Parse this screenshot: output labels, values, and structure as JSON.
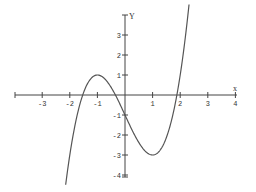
{
  "chart_data": {
    "type": "line",
    "title": "",
    "xlabel": "x",
    "ylabel": "Y",
    "xlim": [
      -4,
      4
    ],
    "ylim": [
      -4,
      4
    ],
    "grid": false,
    "legend": null,
    "x_ticks": [
      -3,
      -2,
      -1,
      1,
      2,
      3,
      4
    ],
    "x_tick_labels": [
      "-3",
      "-2",
      "-1",
      "1",
      "2",
      "3",
      "4"
    ],
    "y_ticks": [
      3,
      2,
      1,
      -1,
      -2,
      -3,
      -4
    ],
    "y_tick_labels": [
      "3",
      "2",
      "1",
      "-1",
      "-2",
      "-3",
      "-4"
    ],
    "series": [
      {
        "name": "cubic curve",
        "function": "y = x^3 - 3x - 1",
        "x_range": [
          -2.15,
          2.32
        ],
        "key_points": [
          {
            "x": -1,
            "y": 1,
            "note": "local maximum"
          },
          {
            "x": 1,
            "y": -3,
            "note": "local minimum"
          },
          {
            "x": 0,
            "y": -1,
            "note": "y-intercept"
          }
        ],
        "color": "#555555"
      }
    ]
  },
  "layout": {
    "origin_px": [
      125,
      95
    ],
    "x_unit_px": 27.6,
    "y_unit_px": 20,
    "x_axis_px": [
      15,
      237
    ],
    "y_axis_px": [
      15,
      177
    ]
  }
}
